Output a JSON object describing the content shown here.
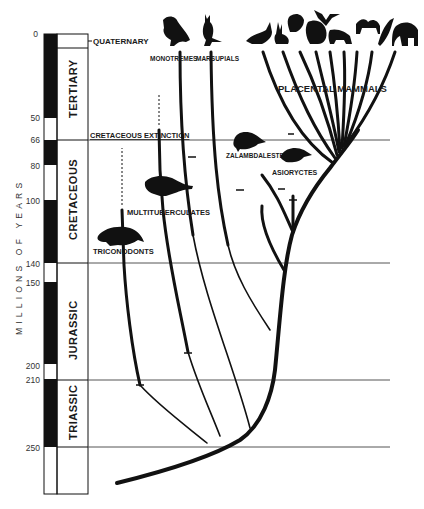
{
  "figure": {
    "type": "phylogenetic-timeline",
    "axis_title": "MILLIONS OF YEARS",
    "ticks": [
      {
        "label": "0",
        "value": 0
      },
      {
        "label": "50",
        "value": 50
      },
      {
        "label": "66",
        "value": 66
      },
      {
        "label": "80",
        "value": 80
      },
      {
        "label": "100",
        "value": 100
      },
      {
        "label": "140",
        "value": 140
      },
      {
        "label": "150",
        "value": 150
      },
      {
        "label": "200",
        "value": 200
      },
      {
        "label": "210",
        "value": 210
      },
      {
        "label": "250",
        "value": 250
      }
    ],
    "periods": [
      {
        "name": "QUATERNARY",
        "start": 0,
        "end": 2
      },
      {
        "name": "TERTIARY",
        "start": 2,
        "end": 66
      },
      {
        "name": "CRETACEOUS",
        "start": 66,
        "end": 140
      },
      {
        "name": "JURASSIC",
        "start": 140,
        "end": 210
      },
      {
        "name": "TRIASSIC",
        "start": 210,
        "end": 250
      }
    ],
    "events": [
      {
        "label": "CRETACEOUS EXTINCTION",
        "value": 66
      }
    ],
    "lineages": [
      {
        "name": "MONOTREMES",
        "survives": true
      },
      {
        "name": "MARSUPIALS",
        "survives": true
      },
      {
        "name": "PLACENTAL MAMMALS",
        "survives": true
      },
      {
        "name": "ZALAMBDALESTES",
        "survives": false
      },
      {
        "name": "ASIORYCTES",
        "survives": false
      },
      {
        "name": "MULTITUBERCULATES",
        "survives": false
      },
      {
        "name": "TRICONODONTS",
        "survives": false
      }
    ],
    "placental_icons": [
      "dinosaur-like-mammal-icon",
      "rabbit-icon",
      "squirrel-icon",
      "gorilla-icon",
      "bat-icon",
      "tiger-icon",
      "camel-icon",
      "dolphin-icon",
      "elephant-icon"
    ],
    "colors": {
      "ink": "#111111",
      "grid": "#555555",
      "background": "#ffffff"
    }
  }
}
